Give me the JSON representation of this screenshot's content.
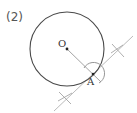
{
  "problem": {
    "label": "(2)"
  },
  "figure": {
    "circle": {
      "cx": 67,
      "cy": 49,
      "r": 37,
      "color": "#4a4a4a"
    },
    "center_point": {
      "label": "O",
      "x": 67,
      "y": 49
    },
    "tangent_point": {
      "label": "A",
      "x": 93,
      "y": 74
    },
    "radius_line": {
      "x1": 67,
      "y1": 49,
      "x2": 101,
      "y2": 82,
      "color": "#9a9a9a"
    },
    "tangent_line": {
      "x1": 133,
      "y1": 36,
      "x2": 54,
      "y2": 111,
      "color": "#b0b0b0"
    },
    "arc_around_A": {
      "r": 10,
      "color": "#8a8a8a"
    },
    "cross_marks": [
      {
        "x": 118,
        "y": 50
      },
      {
        "x": 65,
        "y": 98
      }
    ],
    "construction_color": "#a8a8a8"
  }
}
